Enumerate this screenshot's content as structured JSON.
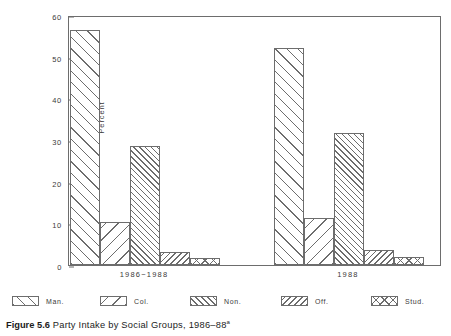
{
  "figure": {
    "caption_label": "Figure 5.6",
    "caption_text": "Party Intake by Social Groups, 1986–88",
    "caption_superscript": "a"
  },
  "chart_data": {
    "type": "bar",
    "title": "",
    "xlabel": "",
    "ylabel": "Percent",
    "ylim": [
      0,
      60
    ],
    "yticks": [
      0,
      10,
      20,
      30,
      40,
      50,
      60
    ],
    "ytick_labels": [
      "0",
      "10",
      "20",
      "30",
      "40",
      "50",
      "60"
    ],
    "grid": false,
    "legend_position": "below-axes",
    "categories": [
      "1986−1988",
      "1988"
    ],
    "series": [
      {
        "name": "Man.",
        "pattern": "diagonal-up-wide",
        "values": [
          56.5,
          52.1
        ]
      },
      {
        "name": "Col.",
        "pattern": "diagonal-down-wide",
        "values": [
          10.3,
          11.4
        ]
      },
      {
        "name": "Non.",
        "pattern": "diagonal-up-dense",
        "values": [
          28.6,
          31.8
        ]
      },
      {
        "name": "Off.",
        "pattern": "diagonal-down-dense",
        "values": [
          3.2,
          3.7
        ]
      },
      {
        "name": "Stud.",
        "pattern": "cross-hatch",
        "values": [
          1.6,
          2.0
        ]
      }
    ]
  },
  "style": {
    "line_color": "#6d6d6d",
    "text_color": "#3a3a3a",
    "caption_color": "#1c1c1c",
    "background": "#ffffff"
  }
}
